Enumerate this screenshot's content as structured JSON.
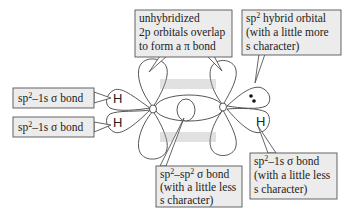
{
  "diagram": {
    "atoms": {
      "carbon_left": "C",
      "carbon_right": "C",
      "h_top_left": "H",
      "h_bottom_left": "H",
      "h_bottom_right": "H"
    },
    "labels": {
      "pi_bond": {
        "line1": "unhybridized",
        "line2": "2p orbitals overlap",
        "line3": "to form a π bond"
      },
      "hybrid_orbital": {
        "line1_main": "sp",
        "line1_sup": "2",
        "line1_rest": " hybrid orbital",
        "line2": "(with a little more",
        "line3": "s character)"
      },
      "sigma_h_top_left": {
        "main": "sp",
        "sup": "2",
        "rest": "–1s σ bond"
      },
      "sigma_h_bottom_left": {
        "main": "sp",
        "sup": "2",
        "rest": "–1s σ bond"
      },
      "sigma_cc": {
        "line1_a": "sp",
        "line1_sup1": "2",
        "line1_b": "–sp",
        "line1_sup2": "2",
        "line1_c": " σ bond",
        "line2": "(with a little less",
        "line3": "s character)"
      },
      "sigma_h_right": {
        "line1_a": "sp",
        "line1_sup": "2",
        "line1_b": "–1s σ bond",
        "line2": "(with a little less",
        "line3": "s character)"
      }
    },
    "lone_pair": "••",
    "colors": {
      "box_fill": "#ececec",
      "box_stroke": "#555555",
      "orbital_stroke": "#444444",
      "text": "#222222"
    }
  }
}
